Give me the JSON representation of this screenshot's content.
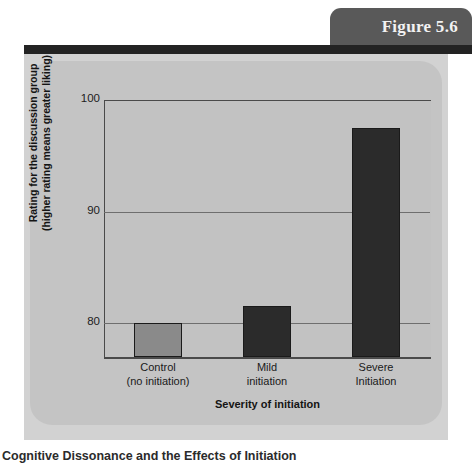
{
  "figure": {
    "number_label": "Figure 5.6",
    "caption": "Cognitive Dissonance and the Effects of Initiation",
    "tab_color": "#595959",
    "rule_color": "#232323",
    "panel_color": "#d2d2d2",
    "chart_panel_color": "#c4c4c4"
  },
  "chart_data": {
    "type": "bar",
    "title": "",
    "subtitle": "",
    "xlabel": "Severity of initiation",
    "ylabel": "Rating for the discussion group (higher rating means greater liking)",
    "ylabel_line1": "Rating for the discussion group",
    "ylabel_line2": "(higher rating means greater liking)",
    "categories": [
      "Control (no initiation)",
      "Mild initiation",
      "Severe Initiation"
    ],
    "category_lines": [
      [
        "Control",
        "(no initiation)"
      ],
      [
        "Mild",
        "initiation"
      ],
      [
        "Severe",
        "Initiation"
      ]
    ],
    "values": [
      80.0,
      81.6,
      97.5
    ],
    "bar_colors": [
      "#8a8a8a",
      "#2b2b2b",
      "#2b2b2b"
    ],
    "ylim": [
      77.0,
      100.0
    ],
    "yticks": [
      100,
      90,
      80
    ],
    "ytick_labels": [
      "100",
      "90",
      "80"
    ],
    "grid": true,
    "grid_axis": "y",
    "legend": false,
    "plot_background": "#c2c2c2",
    "axis_color": "#4a4a4a",
    "gridline_color": "#6e6e6e"
  }
}
